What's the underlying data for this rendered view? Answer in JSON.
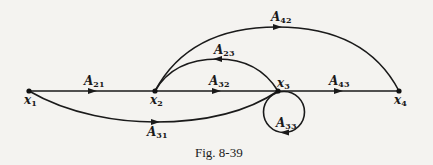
{
  "caption": "Fig. 8-39",
  "nodes": [
    {
      "id": "x1",
      "letter": "x",
      "sub": "1",
      "x": 29,
      "y": 91
    },
    {
      "id": "x2",
      "letter": "x",
      "sub": "2",
      "x": 155,
      "y": 91
    },
    {
      "id": "x3",
      "letter": "x",
      "sub": "3",
      "x": 278,
      "y": 91
    },
    {
      "id": "x4",
      "letter": "x",
      "sub": "4",
      "x": 399,
      "y": 91
    }
  ],
  "edges": [
    {
      "id": "A21",
      "letter": "A",
      "sub": "21",
      "from": "x1",
      "to": "x2"
    },
    {
      "id": "A32",
      "letter": "A",
      "sub": "32",
      "from": "x2",
      "to": "x3"
    },
    {
      "id": "A43",
      "letter": "A",
      "sub": "43",
      "from": "x3",
      "to": "x4"
    },
    {
      "id": "A23",
      "letter": "A",
      "sub": "23",
      "from": "x3",
      "to": "x2"
    },
    {
      "id": "A42",
      "letter": "A",
      "sub": "42",
      "from": "x2",
      "to": "x4"
    },
    {
      "id": "A31",
      "letter": "A",
      "sub": "31",
      "from": "x1",
      "to": "x3"
    },
    {
      "id": "A33",
      "letter": "A",
      "sub": "33",
      "from": "x3",
      "to": "x3"
    }
  ]
}
